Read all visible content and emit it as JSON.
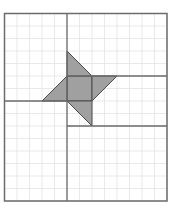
{
  "figure": {
    "type": "grid-geometry-diagram",
    "grid": {
      "columns": 13,
      "rows": 15,
      "unit_px": 12.5,
      "origin_px": [
        4.5,
        13.5
      ]
    },
    "colors": {
      "background": "#ffffff",
      "grid_line": "#e3e3e3",
      "frame_line": "#6b6b6b",
      "shape_fill": "#a0a0a0",
      "shape_edge": "#4a4a4a"
    },
    "frame": {
      "x1": 0,
      "y1": 0,
      "x2": 13,
      "y2": 15
    },
    "lines": [
      {
        "name": "divider-vertical",
        "x1": 5,
        "y1": 0,
        "x2": 5,
        "y2": 15
      },
      {
        "name": "divider-left-horizontal",
        "x1": 0,
        "y1": 7,
        "x2": 5,
        "y2": 7
      },
      {
        "name": "divider-right-upper-horizontal",
        "x1": 5,
        "y1": 5,
        "x2": 13,
        "y2": 5
      },
      {
        "name": "divider-right-lower-horizontal",
        "x1": 5,
        "y1": 9,
        "x2": 13,
        "y2": 9
      }
    ],
    "shaded_shapes": [
      {
        "name": "center-square",
        "points": [
          [
            5,
            5
          ],
          [
            7,
            5
          ],
          [
            7,
            7
          ],
          [
            5,
            7
          ]
        ]
      },
      {
        "name": "top-triangle",
        "points": [
          [
            5,
            3
          ],
          [
            7,
            5
          ],
          [
            5,
            5
          ]
        ]
      },
      {
        "name": "right-triangle",
        "points": [
          [
            7,
            5
          ],
          [
            9,
            5
          ],
          [
            7,
            7
          ]
        ]
      },
      {
        "name": "bottom-triangle",
        "points": [
          [
            5,
            7
          ],
          [
            7,
            7
          ],
          [
            7,
            9
          ]
        ]
      },
      {
        "name": "left-triangle",
        "points": [
          [
            3,
            7
          ],
          [
            5,
            5
          ],
          [
            5,
            7
          ]
        ]
      }
    ]
  }
}
